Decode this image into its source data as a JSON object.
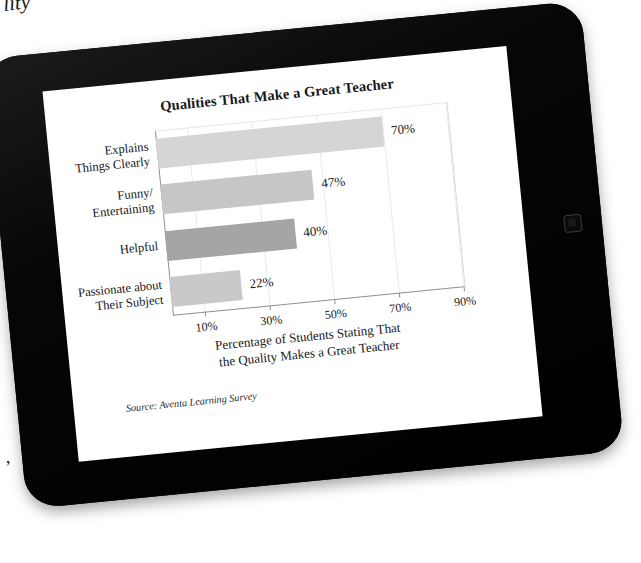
{
  "background_page": {
    "top_fragment": "lity",
    "bottom_fragment": ","
  },
  "device": {
    "name": "tablet",
    "bezel_color": "#080808",
    "screen_color": "#ffffff",
    "home_button": "home-button"
  },
  "chart_data": {
    "type": "bar",
    "orientation": "horizontal",
    "title": "Qualities That Make a Great Teacher",
    "categories": [
      "Explains\nThings Clearly",
      "Funny/\nEntertaining",
      "Helpful",
      "Passionate about\nTheir Subject"
    ],
    "category_lines": [
      [
        "Explains",
        "Things Clearly"
      ],
      [
        "Funny/",
        "Entertaining"
      ],
      [
        "Helpful"
      ],
      [
        "Passionate about",
        "Their Subject"
      ]
    ],
    "values": [
      70,
      47,
      40,
      22
    ],
    "value_labels": [
      "70%",
      "47%",
      "40%",
      "22%"
    ],
    "bar_colors": [
      "#d5d5d5",
      "#c6c6c6",
      "#a5a5a5",
      "#c9c9c9"
    ],
    "xlabel": "Percentage of Students Stating That the Quality Makes a Great Teacher",
    "xlabel_lines": [
      "Percentage of Students Stating That",
      "the Quality Makes a Great Teacher"
    ],
    "ylabel": "",
    "xlim": [
      0,
      90
    ],
    "xticks": [
      10,
      30,
      50,
      70,
      90
    ],
    "xtick_labels": [
      "10%",
      "30%",
      "50%",
      "70%",
      "90%"
    ],
    "grid": true,
    "legend": null,
    "source": "Source: Aventa Learning Survey"
  }
}
